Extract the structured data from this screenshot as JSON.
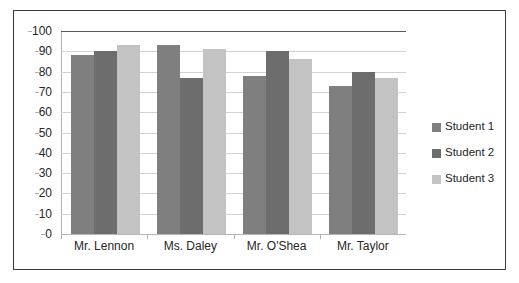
{
  "chart_data": {
    "type": "bar",
    "title": "",
    "subtitle": "",
    "xlabel": "",
    "ylabel": "",
    "categories": [
      "Mr. Lennon",
      "Ms. Daley",
      "Mr. O'Shea",
      "Mr. Taylor"
    ],
    "series": [
      {
        "name": "Student 1",
        "color": "#7f7f7f",
        "values": [
          88,
          93,
          78,
          73
        ]
      },
      {
        "name": "Student 2",
        "color": "#6d6d6d",
        "values": [
          90,
          77,
          90,
          80
        ]
      },
      {
        "name": "Student 3",
        "color": "#c3c3c3",
        "values": [
          93,
          91,
          86,
          77
        ]
      }
    ],
    "ylim": [
      0,
      100
    ],
    "ytick_step": 10,
    "yticks": [
      "100",
      "90",
      "80",
      "70",
      "60",
      "50",
      "40",
      "30",
      "20",
      "10",
      "0"
    ],
    "grid": true,
    "grid_axis": "y",
    "legend_position": "right",
    "legend_entries": [
      "Student 1",
      "Student 2",
      "Student 3"
    ],
    "annotations": [],
    "border_color": "#3b3b3b",
    "gridline_color": "#d2d2d2",
    "background_color": "#ffffff"
  }
}
